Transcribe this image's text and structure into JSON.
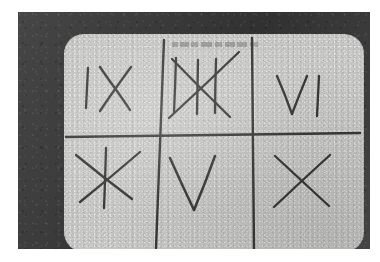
{
  "photo": {
    "kind": "photograph",
    "subject": "hand-drawn tic-tac-toe grid on a light sheet",
    "frame_color": "#3c3c3c",
    "paper_color": "#c6c6c4",
    "ink_color": "#383838",
    "page_background": "#ffffff"
  },
  "caption": {
    "text": "",
    "legible": "illegible",
    "position": "top-center of sheet"
  },
  "grid": {
    "rows": 3,
    "columns": 3,
    "style": "hand-drawn",
    "lines": [
      {
        "name": "vertical-left",
        "x1": 100,
        "y1": 6,
        "x2": 92,
        "y2": 214
      },
      {
        "name": "vertical-right",
        "x1": 188,
        "y1": 4,
        "x2": 190,
        "y2": 216
      },
      {
        "name": "horizontal-mid",
        "x1": 2,
        "y1": 103,
        "x2": 296,
        "y2": 99
      }
    ]
  },
  "board": {
    "cells": [
      {
        "position": "top-left",
        "label": "IX",
        "reading": "vertical stroke followed by an X",
        "strokes": [
          {
            "name": "stroke-vertical",
            "x1": 24,
            "y1": 34,
            "x2": 22,
            "y2": 74
          },
          {
            "name": "stroke-diagonal-down",
            "x1": 36,
            "y1": 33,
            "x2": 66,
            "y2": 76
          },
          {
            "name": "stroke-diagonal-up",
            "x1": 67,
            "y1": 33,
            "x2": 36,
            "y2": 77
          }
        ]
      },
      {
        "position": "top-middle",
        "label": "tally-struck",
        "reading": "three vertical tally strokes crossed by two diagonals",
        "strokes": [
          {
            "name": "tally-1",
            "x1": 112,
            "y1": 24,
            "x2": 110,
            "y2": 78
          },
          {
            "name": "tally-2",
            "x1": 134,
            "y1": 26,
            "x2": 133,
            "y2": 80
          },
          {
            "name": "tally-3",
            "x1": 152,
            "y1": 25,
            "x2": 151,
            "y2": 79
          },
          {
            "name": "cross-diagonal-down",
            "x1": 108,
            "y1": 25,
            "x2": 166,
            "y2": 83
          },
          {
            "name": "cross-diagonal-up",
            "x1": 175,
            "y1": 18,
            "x2": 105,
            "y2": 84
          }
        ]
      },
      {
        "position": "top-right",
        "label": "VI",
        "reading": "letter V followed by a vertical stroke",
        "strokes": [
          {
            "name": "v-left",
            "x1": 213,
            "y1": 42,
            "x2": 228,
            "y2": 80
          },
          {
            "name": "v-right",
            "x1": 228,
            "y1": 80,
            "x2": 243,
            "y2": 42
          },
          {
            "name": "i-vertical",
            "x1": 255,
            "y1": 42,
            "x2": 253,
            "y2": 82
          }
        ]
      },
      {
        "position": "bottom-left",
        "label": "X-struck",
        "reading": "an X with a vertical stroke through it",
        "strokes": [
          {
            "name": "x-diagonal-down",
            "x1": 12,
            "y1": 121,
            "x2": 68,
            "y2": 165
          },
          {
            "name": "x-diagonal-up",
            "x1": 76,
            "y1": 118,
            "x2": 16,
            "y2": 168
          },
          {
            "name": "strike-vertical",
            "x1": 42,
            "y1": 114,
            "x2": 40,
            "y2": 174
          }
        ]
      },
      {
        "position": "bottom-middle",
        "label": "V",
        "reading": "letter V",
        "strokes": [
          {
            "name": "v-left",
            "x1": 106,
            "y1": 124,
            "x2": 130,
            "y2": 176
          },
          {
            "name": "v-right",
            "x1": 130,
            "y1": 176,
            "x2": 151,
            "y2": 122
          }
        ]
      },
      {
        "position": "bottom-right",
        "label": "X",
        "reading": "letter X",
        "strokes": [
          {
            "name": "x-diagonal-down",
            "x1": 211,
            "y1": 122,
            "x2": 265,
            "y2": 172
          },
          {
            "name": "x-diagonal-up",
            "x1": 266,
            "y1": 121,
            "x2": 210,
            "y2": 173
          }
        ]
      }
    ]
  }
}
